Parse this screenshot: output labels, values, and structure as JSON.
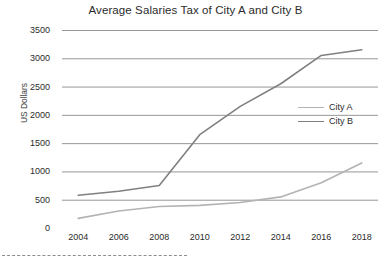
{
  "chart_data": {
    "type": "line",
    "title": "Average Salaries Tax of City A and City B",
    "xlabel": "",
    "ylabel": "US Dollars",
    "x": [
      2004,
      2006,
      2008,
      2010,
      2012,
      2014,
      2016,
      2018
    ],
    "xticklabels": [
      "2004",
      "2006",
      "2008",
      "2010",
      "2012",
      "2014",
      "2016",
      "2018"
    ],
    "yticks": [
      0,
      500,
      1000,
      1500,
      2000,
      2500,
      3000,
      3500
    ],
    "yticklabels": [
      "0",
      "500",
      "1000",
      "1500",
      "2000",
      "2500",
      "3000",
      "3500"
    ],
    "xlim": [
      2003.2,
      2018.8
    ],
    "ylim": [
      0,
      3500
    ],
    "grid": "horizontal",
    "legend_position": "center-right",
    "series": [
      {
        "name": "City A",
        "color": "#b3b3b3",
        "values": [
          170,
          300,
          380,
          400,
          450,
          550,
          800,
          1150
        ]
      },
      {
        "name": "City B",
        "color": "#808080",
        "values": [
          580,
          650,
          750,
          1650,
          2150,
          2550,
          3050,
          3150
        ]
      }
    ]
  },
  "legend": {
    "items": [
      {
        "label": "City A"
      },
      {
        "label": "City B"
      }
    ]
  },
  "colors": {
    "city_a": "#b3b3b3",
    "city_b": "#808080",
    "grid": "#8a8a8a",
    "axis": "#6f6f6f",
    "text": "#2b2b2b"
  }
}
